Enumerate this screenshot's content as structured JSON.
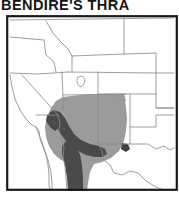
{
  "title": {
    "text": "BENDIRE'S THRA",
    "full_visible": "BENDIRE'S THRA",
    "clipped": true
  },
  "map": {
    "name": "range-map-western-north-america",
    "frame_color": "#1a1a1a",
    "background_color": "#ffffff",
    "boundary_color": "#8d8d8d",
    "coast_color": "#7a7a7a",
    "ranges": [
      {
        "name": "summer-breeding-range",
        "color": "#9b9b9b",
        "description": "Light gray shaded area covering Arizona, New Mexico, southern Utah, southern Nevada and western Texas"
      },
      {
        "name": "year-round-resident-range",
        "color": "#4a4a4a",
        "description": "Dark gray shaded area along the lower Colorado River, southwestern Arizona and northwestern Mexico"
      }
    ],
    "features": [
      {
        "name": "great-salt-lake",
        "color": "#ffffff"
      },
      {
        "name": "baja-california-peninsula"
      },
      {
        "name": "gulf-of-california"
      },
      {
        "name": "pacific-coast"
      }
    ],
    "states_depicted": [
      "Washington",
      "Oregon",
      "Idaho",
      "Montana",
      "Wyoming",
      "Nevada",
      "Utah",
      "Colorado",
      "Nebraska",
      "Kansas",
      "California",
      "Arizona",
      "New Mexico",
      "Oklahoma",
      "Texas"
    ]
  },
  "colors": {
    "title": "#141414",
    "frame": "#1a1a1a",
    "light_range": "#9b9b9b",
    "dark_range": "#4a4a4a",
    "state_line": "#8d8d8d",
    "page_background": "#ffffff"
  }
}
